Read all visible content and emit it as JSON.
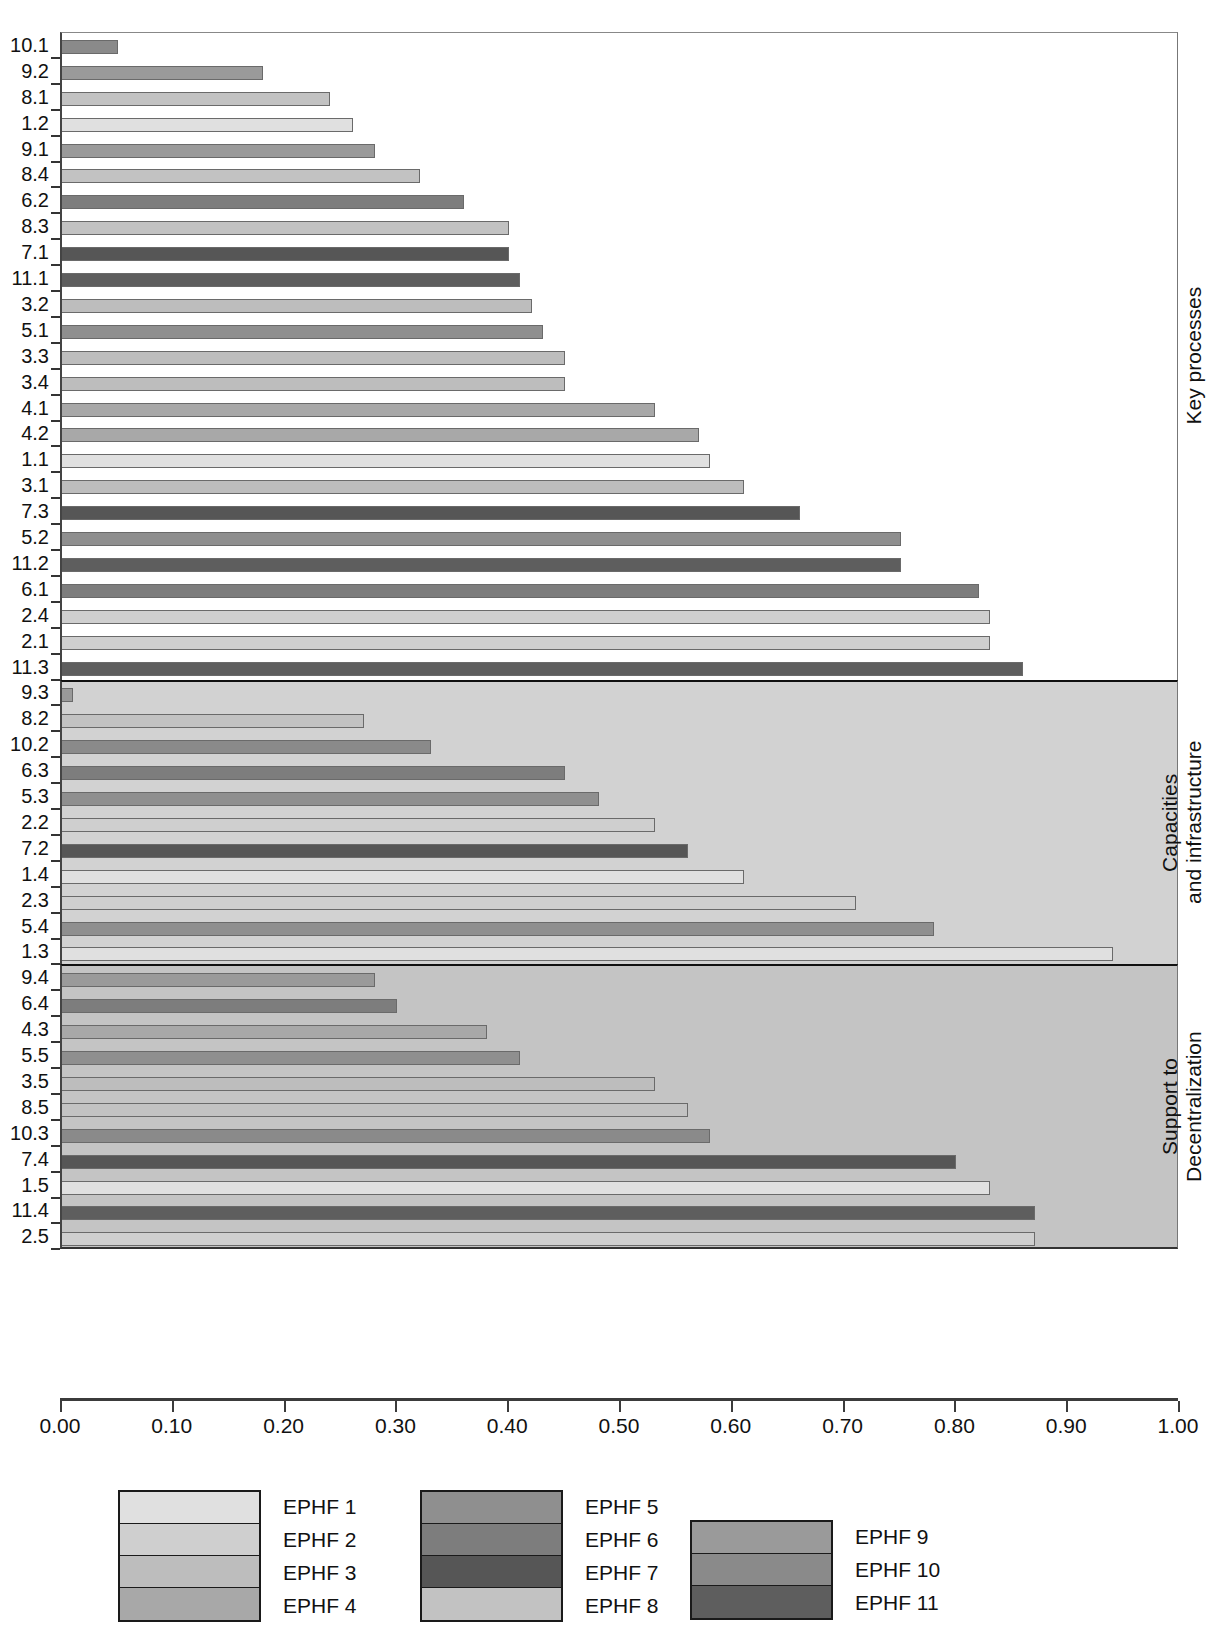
{
  "chart_data": {
    "type": "bar",
    "orientation": "horizontal",
    "title": "",
    "xlabel": "",
    "ylabel": "",
    "xlim": [
      0.0,
      1.0
    ],
    "xticks": [
      "0.00",
      "0.10",
      "0.20",
      "0.30",
      "0.40",
      "0.50",
      "0.60",
      "0.70",
      "0.80",
      "0.90",
      "1.00"
    ],
    "xtick_values": [
      0.0,
      0.1,
      0.2,
      0.3,
      0.4,
      0.5,
      0.6,
      0.7,
      0.8,
      0.9,
      1.0
    ],
    "grid": false,
    "legend_position": "bottom",
    "series_key": "EPHF (Essential Public Health Function) number, taken from the indicator prefix",
    "sections": [
      {
        "name": "Key processes",
        "label": "Key processes",
        "background": "#ffffff",
        "categories": [
          "10.1",
          "9.2",
          "8.1",
          "1.2",
          "9.1",
          "8.4",
          "6.2",
          "8.3",
          "7.1",
          "11.1",
          "3.2",
          "5.1",
          "3.3",
          "3.4",
          "4.1",
          "4.2",
          "1.1",
          "3.1",
          "7.3",
          "5.2",
          "11.2",
          "6.1",
          "2.4",
          "2.1",
          "11.3"
        ],
        "values": [
          0.05,
          0.18,
          0.24,
          0.26,
          0.28,
          0.32,
          0.36,
          0.4,
          0.4,
          0.41,
          0.42,
          0.43,
          0.45,
          0.45,
          0.53,
          0.57,
          0.58,
          0.61,
          0.66,
          0.75,
          0.75,
          0.82,
          0.83,
          0.83,
          0.86
        ],
        "series": [
          10,
          9,
          8,
          1,
          9,
          8,
          6,
          8,
          7,
          11,
          3,
          5,
          3,
          3,
          4,
          4,
          1,
          3,
          7,
          5,
          11,
          6,
          2,
          2,
          11
        ]
      },
      {
        "name": "Capacities and infrastructure",
        "label": "Capacities\nand infrastructure",
        "background": "#d2d2d2",
        "categories": [
          "9.3",
          "8.2",
          "10.2",
          "6.3",
          "5.3",
          "2.2",
          "7.2",
          "1.4",
          "2.3",
          "5.4",
          "1.3"
        ],
        "values": [
          0.01,
          0.27,
          0.33,
          0.45,
          0.48,
          0.53,
          0.56,
          0.61,
          0.71,
          0.78,
          0.94
        ],
        "series": [
          9,
          8,
          10,
          6,
          5,
          2,
          7,
          1,
          2,
          5,
          1
        ]
      },
      {
        "name": "Support to Decentralization",
        "label": "Support to\nDecentralization",
        "background": "#c4c4c4",
        "categories": [
          "9.4",
          "6.4",
          "4.3",
          "5.5",
          "3.5",
          "8.5",
          "10.3",
          "7.4",
          "1.5",
          "11.4",
          "2.5"
        ],
        "values": [
          0.28,
          0.3,
          0.38,
          0.41,
          0.53,
          0.56,
          0.58,
          0.8,
          0.83,
          0.87,
          0.87
        ],
        "series": [
          9,
          6,
          4,
          5,
          3,
          8,
          10,
          7,
          1,
          11,
          2
        ]
      }
    ]
  },
  "legend": {
    "groups": [
      {
        "items": [
          {
            "label": "EPHF 1",
            "color": "#e0e0e0"
          },
          {
            "label": "EPHF 2",
            "color": "#cfcfcf"
          },
          {
            "label": "EPHF 3",
            "color": "#bdbdbd"
          },
          {
            "label": "EPHF 4",
            "color": "#a8a8a8"
          }
        ]
      },
      {
        "items": [
          {
            "label": "EPHF 5",
            "color": "#8f8f8f"
          },
          {
            "label": "EPHF 6",
            "color": "#7d7d7d"
          },
          {
            "label": "EPHF 7",
            "color": "#565656"
          },
          {
            "label": "EPHF 8",
            "color": "#c2c2c2"
          }
        ]
      },
      {
        "items": [
          {
            "label": "EPHF 9",
            "color": "#9a9a9a"
          },
          {
            "label": "EPHF 10",
            "color": "#8a8a8a"
          },
          {
            "label": "EPHF 11",
            "color": "#5e5e5e"
          }
        ]
      }
    ],
    "colors_by_ephf": {
      "1": "#e0e0e0",
      "2": "#cfcfcf",
      "3": "#bdbdbd",
      "4": "#a8a8a8",
      "5": "#8f8f8f",
      "6": "#7d7d7d",
      "7": "#565656",
      "8": "#c2c2c2",
      "9": "#9a9a9a",
      "10": "#8a8a8a",
      "11": "#5e5e5e"
    }
  }
}
